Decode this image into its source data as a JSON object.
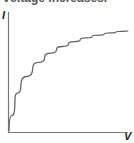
{
  "caption": "voltage increases.",
  "chart_data": {
    "type": "line",
    "title": "",
    "xlabel": "V",
    "ylabel": "I",
    "grid": false,
    "legend": null,
    "x": [
      0,
      0.05,
      0.1,
      0.2,
      0.3,
      0.4,
      0.5,
      0.6,
      0.7,
      0.8,
      0.9,
      1.0
    ],
    "series": [
      {
        "name": "I-V curve",
        "values": [
          0,
          0.28,
          0.42,
          0.58,
          0.68,
          0.75,
          0.8,
          0.84,
          0.87,
          0.89,
          0.91,
          0.92
        ]
      }
    ],
    "xlim": [
      0,
      1
    ],
    "ylim": [
      0,
      1
    ]
  }
}
